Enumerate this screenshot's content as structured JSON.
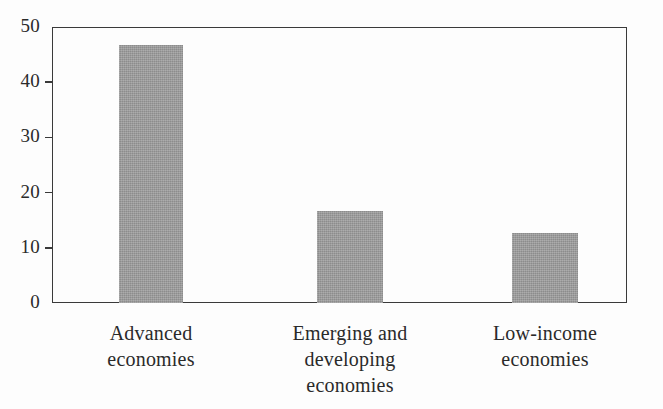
{
  "chart_data": {
    "type": "bar",
    "title": "",
    "subtitle": "",
    "xlabel": "",
    "ylabel": "",
    "categories": [
      "Advanced\neconomies",
      "Emerging and\ndeveloping\neconomies",
      "Low-income\neconomies"
    ],
    "values": [
      46.7,
      16.6,
      12.6
    ],
    "ylim": [
      0,
      50
    ],
    "xlim_categories": 3,
    "yticks": [
      0,
      10,
      20,
      30,
      40,
      50
    ],
    "ytick_labels": [
      "0",
      "10",
      "20",
      "30",
      "40",
      "50"
    ],
    "grid": false,
    "legend": null,
    "legend_position": "none",
    "annotations": [],
    "series": [
      {
        "name": "",
        "values": [
          46.7,
          16.6,
          12.6
        ]
      }
    ],
    "bar_color": "#9a9a9a",
    "frame_color": "#3a3a3a",
    "background_color": "#fdfdfd"
  },
  "axis": {
    "y_ticks": [
      {
        "label": "50",
        "value": 50,
        "has_mark": false
      },
      {
        "label": "40",
        "value": 40,
        "has_mark": true
      },
      {
        "label": "30",
        "value": 30,
        "has_mark": true
      },
      {
        "label": "20",
        "value": 20,
        "has_mark": true
      },
      {
        "label": "10",
        "value": 10,
        "has_mark": true
      },
      {
        "label": "0",
        "value": 0,
        "has_mark": false
      }
    ]
  },
  "bars": [
    {
      "label": "Advanced\neconomies",
      "value": 46.7,
      "left_px": 67,
      "width_px": 64,
      "center_px": 99
    },
    {
      "label": "Emerging and\ndeveloping\neconomies",
      "value": 16.6,
      "left_px": 265,
      "width_px": 66,
      "center_px": 298
    },
    {
      "label": "Low-income\neconomies",
      "value": 12.6,
      "left_px": 460,
      "width_px": 66,
      "center_px": 493
    }
  ]
}
